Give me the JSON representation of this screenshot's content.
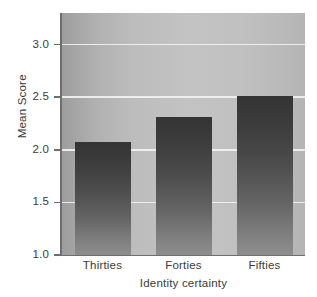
{
  "chart_data": {
    "type": "bar",
    "title": "",
    "subtitle": "",
    "xlabel": "Identity certainty",
    "ylabel": "Mean Score",
    "categories": [
      "Thirties",
      "Forties",
      "Fifties"
    ],
    "values": [
      2.07,
      2.31,
      2.51
    ],
    "series": [
      {
        "name": "Mean Score",
        "values": [
          2.07,
          2.31,
          2.51
        ]
      }
    ],
    "ylim": [
      1.0,
      3.3
    ],
    "yticks": [
      1.0,
      1.5,
      2.0,
      2.5,
      3.0
    ],
    "ytick_labels": [
      "1.0",
      "1.5",
      "2.0",
      "2.5",
      "3.0"
    ],
    "grid": "horizontal-white",
    "legend": "none",
    "annotations": [],
    "colors": {
      "plot_background_light": "#c3c3c3",
      "plot_background_dark": "#9d9d9d",
      "bar_top": "#3a3a3a",
      "bar_bottom": "#8e8e8e",
      "gridline": "#f2f2f2",
      "axis": "#6e6e6e",
      "text": "#3a3a3a",
      "page_background": "#ffffff"
    }
  },
  "axes": {
    "y_title": "Mean Score",
    "x_title": "Identity certainty",
    "y_ticks": [
      {
        "label": "3.0",
        "value": 3.0
      },
      {
        "label": "2.5",
        "value": 2.5
      },
      {
        "label": "2.0",
        "value": 2.0
      },
      {
        "label": "1.5",
        "value": 1.5
      },
      {
        "label": "1.0",
        "value": 1.0
      }
    ],
    "x_ticks": [
      {
        "label": "Thirties"
      },
      {
        "label": "Forties"
      },
      {
        "label": "Fifties"
      }
    ]
  }
}
